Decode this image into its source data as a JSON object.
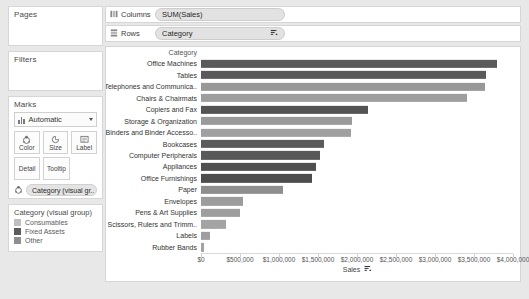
{
  "panels": {
    "pages": {
      "title": "Pages"
    },
    "filters": {
      "title": "Filters"
    },
    "marks": {
      "title": "Marks",
      "mark_type": "Automatic",
      "mark_type_icon": "bar-mark-icon",
      "dropdown_icon": "chevron-down-icon",
      "buttons": [
        {
          "label": "Color",
          "icon": "color-palette-icon"
        },
        {
          "label": "Size",
          "icon": "size-icon"
        },
        {
          "label": "Label",
          "icon": "label-icon"
        },
        {
          "label": "Detail",
          "icon": "detail-icon"
        },
        {
          "label": "Tooltip",
          "icon": "tooltip-icon"
        }
      ],
      "color_pill": {
        "label": "Category (visual gr..",
        "icon": "color-palette-icon"
      }
    },
    "legend": {
      "title": "Category (visual group)",
      "items": [
        {
          "label": "Consumables",
          "color": "#bfbfbf"
        },
        {
          "label": "Fixed Assets",
          "color": "#5c5c5c"
        },
        {
          "label": "Other",
          "color": "#8f8f8f"
        }
      ]
    }
  },
  "shelves": [
    {
      "name": "Columns",
      "icon": "columns-icon",
      "pill": "SUM(Sales)",
      "pill_sort_icon": ""
    },
    {
      "name": "Rows",
      "icon": "rows-icon",
      "pill": "Category",
      "pill_sort_icon": "sort-descending-icon"
    }
  ],
  "chart_data": {
    "type": "bar",
    "orientation": "horizontal",
    "title": "",
    "row_header_title": "Category",
    "xlabel": "Sales",
    "ylabel": "Category",
    "xlim": [
      0,
      4000000
    ],
    "grid": false,
    "legend_position": "left-panel",
    "axis_title_sort_icon": "sort-descending-icon",
    "tick_labels": [
      "$0",
      "$500,000",
      "$1,000,000",
      "$1,500,000",
      "$2,000,000",
      "$2,500,000",
      "$3,000,000",
      "$3,500,000",
      "$4,000,000"
    ],
    "tick_values": [
      0,
      500000,
      1000000,
      1500000,
      2000000,
      2500000,
      3000000,
      3500000,
      4000000
    ],
    "categories": [
      "Office Machines",
      "Tables",
      "Telephones and Communica..",
      "Chairs & Chairmats",
      "Copiers and Fax",
      "Storage & Organization",
      "Binders and Binder Accesso..",
      "Bookcases",
      "Computer Peripherals",
      "Appliances",
      "Office Furnishings",
      "Paper",
      "Envelopes",
      "Pens & Art Supplies",
      "Scissors, Rulers and Trimm..",
      "Labels",
      "Rubber Bands"
    ],
    "values": [
      3800000,
      3650000,
      3640000,
      3410000,
      2140000,
      1930000,
      1920000,
      1580000,
      1530000,
      1480000,
      1420000,
      1050000,
      540000,
      500000,
      320000,
      110000,
      40000
    ],
    "colors": [
      "#5a5a5a",
      "#5a5a5a",
      "#989898",
      "#9e9e9e",
      "#545454",
      "#9a9a9a",
      "#a0a0a0",
      "#5b5b5b",
      "#595959",
      "#4f4f4f",
      "#4c4c4c",
      "#8e8e8e",
      "#9c9c9c",
      "#9e9e9e",
      "#a4a4a4",
      "#9f9f9f",
      "#a2a2a2"
    ],
    "group_of_category": [
      "Fixed Assets",
      "Fixed Assets",
      "Other",
      "Other",
      "Fixed Assets",
      "Other",
      "Consumables",
      "Fixed Assets",
      "Fixed Assets",
      "Fixed Assets",
      "Fixed Assets",
      "Consumables",
      "Consumables",
      "Consumables",
      "Consumables",
      "Consumables",
      "Consumables"
    ]
  }
}
